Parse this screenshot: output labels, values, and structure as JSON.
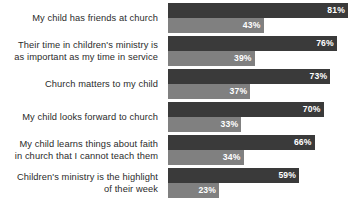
{
  "chart_data": {
    "type": "bar",
    "orientation": "horizontal",
    "title": "",
    "subtitle": "",
    "xlabel": "",
    "ylabel": "",
    "xlim": [
      0,
      100
    ],
    "grid": false,
    "legend": "none",
    "value_suffix": "%",
    "categories": [
      "My child has friends at church",
      "Their time in children's ministry is as important as my time in service",
      "Church matters to my child",
      "My child looks forward to church",
      "My child learns things about faith in church that I cannot teach them",
      "Children's ministry is the highlight of their week"
    ],
    "category_lines": [
      [
        "My child has friends at church"
      ],
      [
        "Their time in children's ministry is",
        "as important as my time in service"
      ],
      [
        "Church matters to my child"
      ],
      [
        "My child looks forward to church"
      ],
      [
        "My child learns things about faith",
        "in church that I cannot teach them"
      ],
      [
        "Children's ministry is the highlight",
        "of their week"
      ]
    ],
    "series": [
      {
        "name": "primary",
        "color": "#3a3a3a",
        "values": [
          81,
          76,
          73,
          70,
          66,
          59
        ],
        "labels": [
          "81%",
          "76%",
          "73%",
          "70%",
          "66%",
          "59%"
        ]
      },
      {
        "name": "secondary",
        "color": "#808080",
        "values": [
          43,
          39,
          37,
          33,
          34,
          23
        ],
        "labels": [
          "43%",
          "39%",
          "37%",
          "33%",
          "34%",
          "23%"
        ]
      }
    ]
  },
  "colors": {
    "primary_bar": "#3a3a3a",
    "secondary_bar": "#808080",
    "label_text": "#2b2b2b",
    "value_text": "#ffffff",
    "background": "#ffffff"
  }
}
